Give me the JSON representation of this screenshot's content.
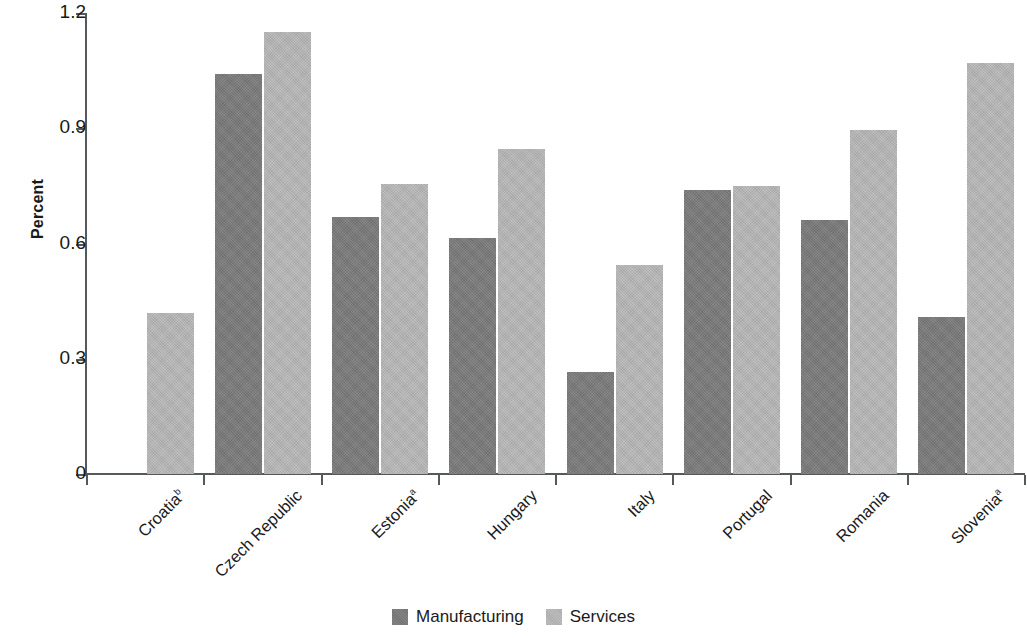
{
  "chart_data": {
    "type": "bar",
    "title": "",
    "subtitle": "",
    "xlabel": "",
    "ylabel": "Percent",
    "ylim": [
      0,
      1.2
    ],
    "yticks": [
      "0",
      "0.3",
      "0.6",
      "0.9",
      "1.2"
    ],
    "ytick_values": [
      0,
      0.3,
      0.6,
      0.9,
      1.2
    ],
    "grid": false,
    "legend_position": "bottom-center",
    "categories": [
      "Croatia",
      "Czech Republic",
      "Estonia",
      "Hungary",
      "Italy",
      "Portugal",
      "Romania",
      "Slovenia"
    ],
    "category_footnotes": [
      "b",
      "",
      "a",
      "",
      "",
      "",
      "",
      "a"
    ],
    "series": [
      {
        "name": "Manufacturing",
        "color": "#7b7b7b",
        "values": [
          null,
          1.04,
          0.67,
          0.615,
          0.265,
          0.74,
          0.66,
          0.41
        ]
      },
      {
        "name": "Services",
        "color": "#b6b6b6",
        "values": [
          0.42,
          1.15,
          0.755,
          0.845,
          0.545,
          0.75,
          0.895,
          1.07
        ]
      }
    ]
  },
  "legend": {
    "items": [
      {
        "label": "Manufacturing",
        "key": "manufacturing"
      },
      {
        "label": "Services",
        "key": "services"
      }
    ]
  },
  "axis": {
    "y_title": "Percent"
  }
}
